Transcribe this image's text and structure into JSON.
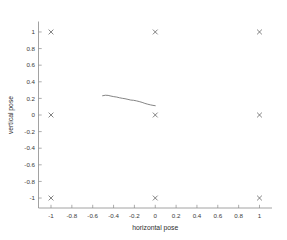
{
  "chart_data": {
    "type": "scatter",
    "title": "",
    "xlabel": "horizontal pose",
    "ylabel": "vertical pose",
    "xlim": [
      -1.12,
      1.12
    ],
    "ylim": [
      -1.12,
      1.12
    ],
    "xticks": [
      -1,
      -0.8,
      -0.6,
      -0.4,
      -0.2,
      0,
      0.2,
      0.4,
      0.6,
      0.8,
      1
    ],
    "yticks": [
      -1,
      -0.8,
      -0.6,
      -0.4,
      -0.2,
      0,
      0.2,
      0.4,
      0.6,
      0.8,
      1
    ],
    "xticklabels": [
      "-1",
      "-0.8",
      "-0.6",
      "-0.4",
      "-0.2",
      "0",
      "0.2",
      "0.4",
      "0.6",
      "0.8",
      "1"
    ],
    "yticklabels": [
      "-1",
      "-0.8",
      "-0.6",
      "-0.4",
      "-0.2",
      "0",
      "0.2",
      "0.4",
      "0.6",
      "0.8",
      "1"
    ],
    "grid": false,
    "legend": null,
    "box": false,
    "series": [
      {
        "name": "reference poses",
        "type": "scatter",
        "marker": "x",
        "color": "#5a5a5a",
        "points": [
          {
            "x": -1,
            "y": 1
          },
          {
            "x": 0,
            "y": 1
          },
          {
            "x": 1,
            "y": 1
          },
          {
            "x": -1,
            "y": 0
          },
          {
            "x": 0,
            "y": 0
          },
          {
            "x": 1,
            "y": 0
          },
          {
            "x": -1,
            "y": -1
          },
          {
            "x": 0,
            "y": -1
          },
          {
            "x": 1,
            "y": -1
          }
        ]
      },
      {
        "name": "estimated trajectory",
        "type": "line",
        "color": "#6e6e6e",
        "points": [
          {
            "x": -0.505,
            "y": 0.232
          },
          {
            "x": -0.478,
            "y": 0.238
          },
          {
            "x": -0.452,
            "y": 0.236
          },
          {
            "x": -0.425,
            "y": 0.228
          },
          {
            "x": -0.398,
            "y": 0.221
          },
          {
            "x": -0.37,
            "y": 0.216
          },
          {
            "x": -0.344,
            "y": 0.208
          },
          {
            "x": -0.316,
            "y": 0.201
          },
          {
            "x": -0.29,
            "y": 0.196
          },
          {
            "x": -0.262,
            "y": 0.188
          },
          {
            "x": -0.235,
            "y": 0.18
          },
          {
            "x": -0.208,
            "y": 0.177
          },
          {
            "x": -0.18,
            "y": 0.17
          },
          {
            "x": -0.154,
            "y": 0.162
          },
          {
            "x": -0.126,
            "y": 0.152
          },
          {
            "x": -0.1,
            "y": 0.14
          },
          {
            "x": -0.072,
            "y": 0.13
          },
          {
            "x": -0.046,
            "y": 0.122
          },
          {
            "x": -0.022,
            "y": 0.116
          },
          {
            "x": 0.0,
            "y": 0.112
          }
        ]
      }
    ]
  }
}
